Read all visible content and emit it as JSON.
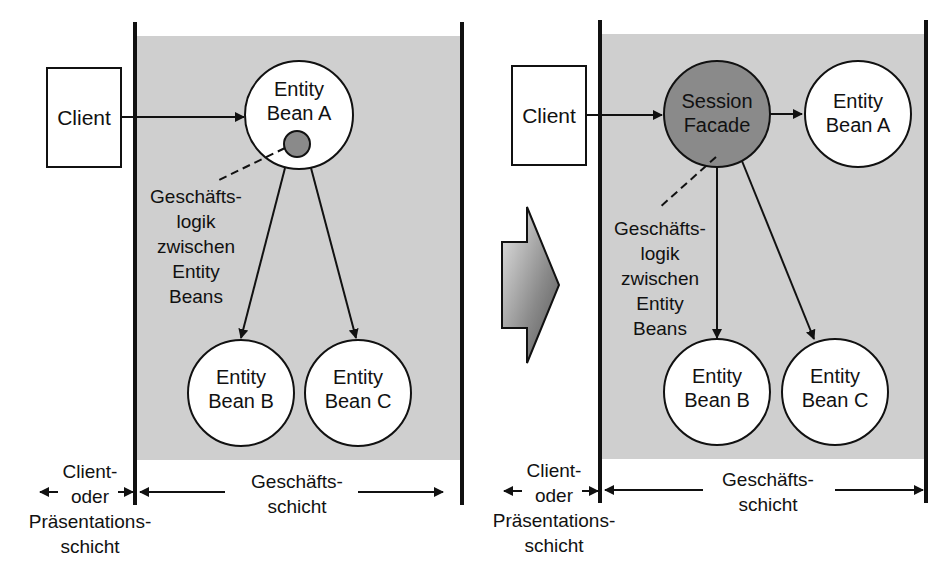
{
  "colors": {
    "tier_background": "#cfcfcf",
    "session_facade_fill": "#8a8a8a",
    "logic_dot_fill": "#8a8a8a",
    "stroke": "#111111",
    "node_fill": "#ffffff"
  },
  "left": {
    "client_label": "Client",
    "entity_a": [
      "Entity",
      "Bean A"
    ],
    "entity_b": [
      "Entity",
      "Bean B"
    ],
    "entity_c": [
      "Entity",
      "Bean C"
    ],
    "logic_note": [
      "Geschäfts-",
      "logik",
      "zwischen",
      "Entity",
      "Beans"
    ],
    "client_tier": [
      "Client-",
      "oder",
      "Präsentations-",
      "schicht"
    ],
    "business_tier": [
      "Geschäfts-",
      "schicht"
    ]
  },
  "right": {
    "client_label": "Client",
    "session_facade": [
      "Session",
      "Facade"
    ],
    "entity_a": [
      "Entity",
      "Bean A"
    ],
    "entity_b": [
      "Entity",
      "Bean B"
    ],
    "entity_c": [
      "Entity",
      "Bean C"
    ],
    "logic_note": [
      "Geschäfts-",
      "logik",
      "zwischen",
      "Entity",
      "Beans"
    ],
    "client_tier": [
      "Client-",
      "oder",
      "Präsentations-",
      "schicht"
    ],
    "business_tier": [
      "Geschäfts-",
      "schicht"
    ]
  },
  "transition_arrow": "right-arrow-icon"
}
